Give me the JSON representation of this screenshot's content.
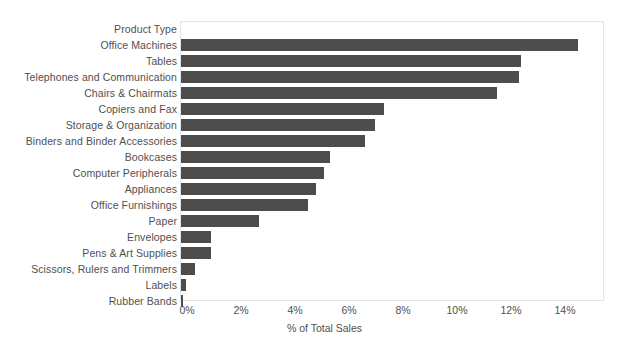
{
  "chart_data": {
    "type": "bar",
    "orientation": "horizontal",
    "title": "",
    "xlabel": "% of Total Sales",
    "ylabel": "Product Type",
    "categories": [
      "Office Machines",
      "Tables",
      "Telephones and Communication",
      "Chairs & Chairmats",
      "Copiers and Fax",
      "Storage & Organization",
      "Binders and Binder Accessories",
      "Bookcases",
      "Computer Peripherals",
      "Appliances",
      "Office Furnishings",
      "Paper",
      "Envelopes",
      "Pens & Art Supplies",
      "Scissors, Rulers and Trimmers",
      "Labels",
      "Rubber Bands"
    ],
    "values": [
      14.7,
      12.6,
      12.5,
      11.7,
      7.5,
      7.2,
      6.8,
      5.5,
      5.3,
      5.0,
      4.7,
      2.9,
      1.1,
      1.1,
      0.5,
      0.2,
      0.08
    ],
    "value_unit": "%",
    "xlim": [
      0,
      15.6
    ],
    "xticks": [
      0,
      2,
      4,
      6,
      8,
      10,
      12,
      14
    ],
    "xtick_labels": [
      "0%",
      "2%",
      "4%",
      "6%",
      "8%",
      "10%",
      "12%",
      "14%"
    ],
    "grid": false,
    "legend": null,
    "bar_color": "#4d4d4d",
    "plot_border_color": "#e4e4e4",
    "text_color": "#4f4f4f",
    "header_label": "Product Type"
  }
}
